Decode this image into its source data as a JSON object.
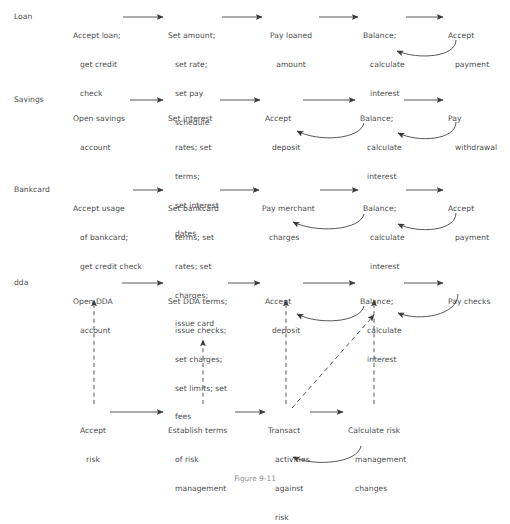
{
  "figure": {
    "caption": "Figure 9-11",
    "text_color": "#4d4d4d",
    "line_color": "#3a3a3a",
    "background": "#ffffff"
  },
  "rows": [
    {
      "id": "loan",
      "label": "Loan",
      "nodes": [
        {
          "id": "loan-accept-loan",
          "lines": [
            "Accept loan;",
            "get credit",
            "check"
          ]
        },
        {
          "id": "loan-set-amount",
          "lines": [
            "Set amount;",
            "set rate;",
            "set pay",
            "schedule"
          ]
        },
        {
          "id": "loan-pay-loaned",
          "lines": [
            "Pay loaned",
            "amount"
          ]
        },
        {
          "id": "loan-balance",
          "lines": [
            "Balance;",
            "calculate",
            "interest"
          ]
        },
        {
          "id": "loan-accept-payment",
          "lines": [
            "Accept",
            "payment"
          ]
        }
      ]
    },
    {
      "id": "savings",
      "label": "Savings",
      "nodes": [
        {
          "id": "savings-open-account",
          "lines": [
            "Open savings",
            "account"
          ]
        },
        {
          "id": "savings-set-interest",
          "lines": [
            "Set interest",
            "rates; set",
            "terms;",
            "set interest",
            "dates"
          ]
        },
        {
          "id": "savings-accept-deposit",
          "lines": [
            "Accept",
            "deposit"
          ]
        },
        {
          "id": "savings-balance",
          "lines": [
            "Balance;",
            "calculate",
            "interest"
          ]
        },
        {
          "id": "savings-pay-withdrawal",
          "lines": [
            "Pay",
            "withdrawal"
          ]
        }
      ]
    },
    {
      "id": "bankcard",
      "label": "Bankcard",
      "nodes": [
        {
          "id": "bankcard-accept-usage",
          "lines": [
            "Accept usage",
            "of bankcard;",
            "get credit check"
          ]
        },
        {
          "id": "bankcard-set-terms",
          "lines": [
            "Set bankcard",
            "terms; set",
            "rates; set",
            "charges;",
            "issue card"
          ]
        },
        {
          "id": "bankcard-pay-merchant",
          "lines": [
            "Pay merchant",
            "charges"
          ]
        },
        {
          "id": "bankcard-balance",
          "lines": [
            "Balance;",
            "calculate",
            "interest"
          ]
        },
        {
          "id": "bankcard-accept-payment",
          "lines": [
            "Accept",
            "payment"
          ]
        }
      ]
    },
    {
      "id": "dda",
      "label": "dda",
      "nodes": [
        {
          "id": "dda-open-account",
          "lines": [
            "Open DDA",
            "account"
          ]
        },
        {
          "id": "dda-set-terms",
          "lines": [
            "Set DDA terms;",
            "issue checks;",
            "set charges;",
            "set limits; set",
            "fees"
          ]
        },
        {
          "id": "dda-accept-deposit",
          "lines": [
            "Accept",
            "deposit"
          ]
        },
        {
          "id": "dda-balance",
          "lines": [
            "Balance;",
            "calculate",
            "interest"
          ]
        },
        {
          "id": "dda-pay-checks",
          "lines": [
            "Pay checks"
          ]
        }
      ]
    },
    {
      "id": "risk",
      "label": "",
      "nodes": [
        {
          "id": "risk-accept-risk",
          "lines": [
            "Accept",
            "risk"
          ]
        },
        {
          "id": "risk-establish-terms",
          "lines": [
            "Establish terms",
            "of risk",
            "management"
          ]
        },
        {
          "id": "risk-transact",
          "lines": [
            "Transact",
            "activities",
            "against",
            "risk"
          ]
        },
        {
          "id": "risk-calculate",
          "lines": [
            "Calculate risk",
            "management",
            "changes"
          ]
        }
      ]
    }
  ],
  "edges": {
    "solid_arrow_label": "sequence-arrow",
    "curved_feedback_label": "feedback-arrow",
    "dashed_arrow_label": "dependency-arrow"
  }
}
